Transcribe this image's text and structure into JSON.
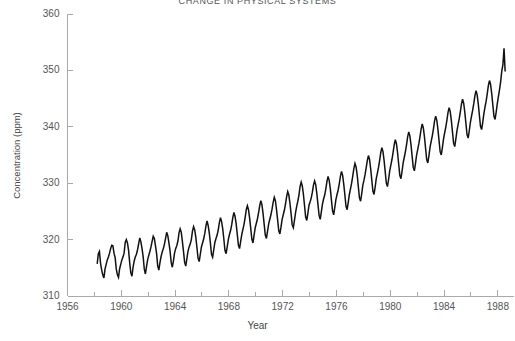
{
  "chart_data": {
    "type": "line",
    "title": "CHANGE IN PHYSICAL SYSTEMS",
    "xlabel": "Year",
    "ylabel": "Concentration  (ppm)",
    "xlim": [
      1956,
      1989.2
    ],
    "ylim": [
      310,
      360
    ],
    "grid": false,
    "legend": "none",
    "line_color": "#111111",
    "axis_color": "#aaaaaa",
    "x_major_ticks": [
      1956,
      1960,
      1964,
      1968,
      1972,
      1976,
      1980,
      1984,
      1988
    ],
    "x_major_tick_labels": [
      "1956",
      "1960",
      "1964",
      "1968",
      "1972",
      "1976",
      "1980",
      "1984",
      "1988"
    ],
    "x_minor_ticks": [
      1958,
      1962,
      1966,
      1970,
      1974,
      1978,
      1982,
      1986
    ],
    "y_ticks": [
      310,
      320,
      330,
      340,
      350,
      360
    ],
    "y_tick_labels": [
      "310",
      "320",
      "330",
      "340",
      "350",
      "360"
    ],
    "series": [
      {
        "name": "Atmospheric CO2 concentration",
        "x": [
          1958.208,
          1958.292,
          1958.375,
          1958.458,
          1958.542,
          1958.625,
          1958.708,
          1958.792,
          1958.875,
          1958.958,
          1959.042,
          1959.125,
          1959.208,
          1959.292,
          1959.375,
          1959.458,
          1959.542,
          1959.625,
          1959.708,
          1959.792,
          1959.875,
          1959.958,
          1960.042,
          1960.125,
          1960.208,
          1960.292,
          1960.375,
          1960.458,
          1960.542,
          1960.625,
          1960.708,
          1960.792,
          1960.875,
          1960.958,
          1961.042,
          1961.125,
          1961.208,
          1961.292,
          1961.375,
          1961.458,
          1961.542,
          1961.625,
          1961.708,
          1961.792,
          1961.875,
          1961.958,
          1962.042,
          1962.125,
          1962.208,
          1962.292,
          1962.375,
          1962.458,
          1962.542,
          1962.625,
          1962.708,
          1962.792,
          1962.875,
          1962.958,
          1963.042,
          1963.125,
          1963.208,
          1963.292,
          1963.375,
          1963.458,
          1963.542,
          1963.625,
          1963.708,
          1963.792,
          1963.875,
          1963.958,
          1964.042,
          1964.125,
          1964.208,
          1964.292,
          1964.375,
          1964.458,
          1964.542,
          1964.625,
          1964.708,
          1964.792,
          1964.875,
          1964.958,
          1965.042,
          1965.125,
          1965.208,
          1965.292,
          1965.375,
          1965.458,
          1965.542,
          1965.625,
          1965.708,
          1965.792,
          1965.875,
          1965.958,
          1966.042,
          1966.125,
          1966.208,
          1966.292,
          1966.375,
          1966.458,
          1966.542,
          1966.625,
          1966.708,
          1966.792,
          1966.875,
          1966.958,
          1967.042,
          1967.125,
          1967.208,
          1967.292,
          1967.375,
          1967.458,
          1967.542,
          1967.625,
          1967.708,
          1967.792,
          1967.875,
          1967.958,
          1968.042,
          1968.125,
          1968.208,
          1968.292,
          1968.375,
          1968.458,
          1968.542,
          1968.625,
          1968.708,
          1968.792,
          1968.875,
          1968.958,
          1969.042,
          1969.125,
          1969.208,
          1969.292,
          1969.375,
          1969.458,
          1969.542,
          1969.625,
          1969.708,
          1969.792,
          1969.875,
          1969.958,
          1970.042,
          1970.125,
          1970.208,
          1970.292,
          1970.375,
          1970.458,
          1970.542,
          1970.625,
          1970.708,
          1970.792,
          1970.875,
          1970.958,
          1971.042,
          1971.125,
          1971.208,
          1971.292,
          1971.375,
          1971.458,
          1971.542,
          1971.625,
          1971.708,
          1971.792,
          1971.875,
          1971.958,
          1972.042,
          1972.125,
          1972.208,
          1972.292,
          1972.375,
          1972.458,
          1972.542,
          1972.625,
          1972.708,
          1972.792,
          1972.875,
          1972.958,
          1973.042,
          1973.125,
          1973.208,
          1973.292,
          1973.375,
          1973.458,
          1973.542,
          1973.625,
          1973.708,
          1973.792,
          1973.875,
          1973.958,
          1974.042,
          1974.125,
          1974.208,
          1974.292,
          1974.375,
          1974.458,
          1974.542,
          1974.625,
          1974.708,
          1974.792,
          1974.875,
          1974.958,
          1975.042,
          1975.125,
          1975.208,
          1975.292,
          1975.375,
          1975.458,
          1975.542,
          1975.625,
          1975.708,
          1975.792,
          1975.875,
          1975.958,
          1976.042,
          1976.125,
          1976.208,
          1976.292,
          1976.375,
          1976.458,
          1976.542,
          1976.625,
          1976.708,
          1976.792,
          1976.875,
          1976.958,
          1977.042,
          1977.125,
          1977.208,
          1977.292,
          1977.375,
          1977.458,
          1977.542,
          1977.625,
          1977.708,
          1977.792,
          1977.875,
          1977.958,
          1978.042,
          1978.125,
          1978.208,
          1978.292,
          1978.375,
          1978.458,
          1978.542,
          1978.625,
          1978.708,
          1978.792,
          1978.875,
          1978.958,
          1979.042,
          1979.125,
          1979.208,
          1979.292,
          1979.375,
          1979.458,
          1979.542,
          1979.625,
          1979.708,
          1979.792,
          1979.875,
          1979.958,
          1980.042,
          1980.125,
          1980.208,
          1980.292,
          1980.375,
          1980.458,
          1980.542,
          1980.625,
          1980.708,
          1980.792,
          1980.875,
          1980.958,
          1981.042,
          1981.125,
          1981.208,
          1981.292,
          1981.375,
          1981.458,
          1981.542,
          1981.625,
          1981.708,
          1981.792,
          1981.875,
          1981.958,
          1982.042,
          1982.125,
          1982.208,
          1982.292,
          1982.375,
          1982.458,
          1982.542,
          1982.625,
          1982.708,
          1982.792,
          1982.875,
          1982.958,
          1983.042,
          1983.125,
          1983.208,
          1983.292,
          1983.375,
          1983.458,
          1983.542,
          1983.625,
          1983.708,
          1983.792,
          1983.875,
          1983.958,
          1984.042,
          1984.125,
          1984.208,
          1984.292,
          1984.375,
          1984.458,
          1984.542,
          1984.625,
          1984.708,
          1984.792,
          1984.875,
          1984.958,
          1985.042,
          1985.125,
          1985.208,
          1985.292,
          1985.375,
          1985.458,
          1985.542,
          1985.625,
          1985.708,
          1985.792,
          1985.875,
          1985.958,
          1986.042,
          1986.125,
          1986.208,
          1986.292,
          1986.375,
          1986.458,
          1986.542,
          1986.625,
          1986.708,
          1986.792,
          1986.875,
          1986.958,
          1987.042,
          1987.125,
          1987.208,
          1987.292,
          1987.375,
          1987.458,
          1987.542,
          1987.625,
          1987.708,
          1987.792,
          1987.875,
          1987.958,
          1988.042,
          1988.125,
          1988.208,
          1988.292,
          1988.375,
          1988.458,
          1988.542
        ],
        "y": [
          315.7,
          317.5,
          317.9,
          315.8,
          314.6,
          313.7,
          313.2,
          314.8,
          315.6,
          316.4,
          316.9,
          317.6,
          318.4,
          319.0,
          318.9,
          317.6,
          316.8,
          314.8,
          313.8,
          313.3,
          314.8,
          315.6,
          316.4,
          316.9,
          317.6,
          319.5,
          320.0,
          319.4,
          318.1,
          315.9,
          314.1,
          313.5,
          315.1,
          316.2,
          316.9,
          317.4,
          318.2,
          319.3,
          320.3,
          319.6,
          318.4,
          317.0,
          314.8,
          313.9,
          315.2,
          316.4,
          317.2,
          317.9,
          318.7,
          319.7,
          320.6,
          320.2,
          318.9,
          317.5,
          315.3,
          314.6,
          315.9,
          317.0,
          317.8,
          318.4,
          319.2,
          320.2,
          321.3,
          320.7,
          319.4,
          318.0,
          316.0,
          315.1,
          316.2,
          317.6,
          318.4,
          318.9,
          319.7,
          321.2,
          321.9,
          321.3,
          319.7,
          317.9,
          316.0,
          315.3,
          316.6,
          317.9,
          318.7,
          319.2,
          320.0,
          321.5,
          322.3,
          321.7,
          320.4,
          318.6,
          316.7,
          316.1,
          317.4,
          318.7,
          319.4,
          320.1,
          321.1,
          322.4,
          323.3,
          322.5,
          321.2,
          319.4,
          317.4,
          316.9,
          318.2,
          319.5,
          320.2,
          320.8,
          321.7,
          323.0,
          323.9,
          323.2,
          321.9,
          320.1,
          318.1,
          317.5,
          318.7,
          320.0,
          320.9,
          321.6,
          322.6,
          323.9,
          324.8,
          324.1,
          322.8,
          320.9,
          319.0,
          318.4,
          319.7,
          320.9,
          321.8,
          322.7,
          323.9,
          325.3,
          326.0,
          325.3,
          323.8,
          322.0,
          320.1,
          319.4,
          320.8,
          322.1,
          322.9,
          323.7,
          324.8,
          326.0,
          326.9,
          326.2,
          324.6,
          322.7,
          320.8,
          320.2,
          321.5,
          322.8,
          323.6,
          324.4,
          325.4,
          326.6,
          327.5,
          326.9,
          325.3,
          323.5,
          321.6,
          321.0,
          322.2,
          323.6,
          324.4,
          325.2,
          326.3,
          327.6,
          328.5,
          327.9,
          326.4,
          324.6,
          322.6,
          322.1,
          323.4,
          324.8,
          325.9,
          326.8,
          327.9,
          329.4,
          330.2,
          329.5,
          328.0,
          326.0,
          324.0,
          323.4,
          324.7,
          326.1,
          326.7,
          327.4,
          328.4,
          329.7,
          330.4,
          329.7,
          328.1,
          326.2,
          324.3,
          323.6,
          324.9,
          326.3,
          327.2,
          327.9,
          329.0,
          330.3,
          331.2,
          330.5,
          329.0,
          327.0,
          325.1,
          324.4,
          325.7,
          327.1,
          328.0,
          328.8,
          329.9,
          331.2,
          332.1,
          331.4,
          329.8,
          327.9,
          325.9,
          325.3,
          326.6,
          328.0,
          329.0,
          330.0,
          331.2,
          332.6,
          333.5,
          332.9,
          331.4,
          329.4,
          327.4,
          326.8,
          328.1,
          329.6,
          330.5,
          331.5,
          332.7,
          334.0,
          334.9,
          334.2,
          332.6,
          330.6,
          328.6,
          328.0,
          329.3,
          330.8,
          331.8,
          332.8,
          334.0,
          335.4,
          336.3,
          335.6,
          334.0,
          332.0,
          330.0,
          329.4,
          330.7,
          332.2,
          333.2,
          334.2,
          335.4,
          336.8,
          337.7,
          337.0,
          335.4,
          333.4,
          331.4,
          330.8,
          332.1,
          333.6,
          334.6,
          335.6,
          336.8,
          338.2,
          339.1,
          338.4,
          336.8,
          334.8,
          332.8,
          332.2,
          333.5,
          335.0,
          336.0,
          337.0,
          338.2,
          339.6,
          340.5,
          339.8,
          338.2,
          336.2,
          334.2,
          333.6,
          334.9,
          336.4,
          337.4,
          338.4,
          339.6,
          341.0,
          341.9,
          341.2,
          339.6,
          337.6,
          335.6,
          335.0,
          336.3,
          337.8,
          338.9,
          339.9,
          341.1,
          342.5,
          343.4,
          342.7,
          341.1,
          339.1,
          337.1,
          336.5,
          337.8,
          339.3,
          340.4,
          341.4,
          342.6,
          344.0,
          344.9,
          344.2,
          342.6,
          340.6,
          338.6,
          338.0,
          339.3,
          340.8,
          341.9,
          342.9,
          344.1,
          345.5,
          346.4,
          345.7,
          344.1,
          342.1,
          340.1,
          339.5,
          340.8,
          342.3,
          343.5,
          344.5,
          345.8,
          347.3,
          348.2,
          347.5,
          345.9,
          343.9,
          341.9,
          341.3,
          342.6,
          344.1,
          345.4,
          346.6,
          348.0,
          349.9,
          351.0,
          353.9,
          349.8
        ]
      }
    ]
  }
}
